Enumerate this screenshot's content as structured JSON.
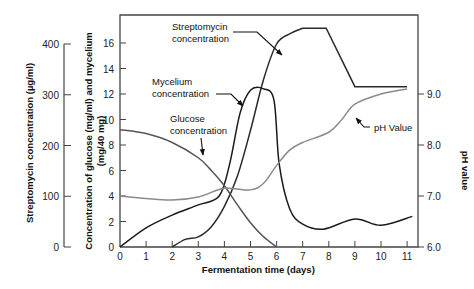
{
  "chart_data": {
    "type": "line",
    "title": "",
    "xlabel": "Fermentation time (days)",
    "x_ticks": [
      0,
      1,
      2,
      3,
      4,
      5,
      6,
      7,
      8,
      9,
      10,
      11
    ],
    "xlim": [
      0,
      11.4
    ],
    "axes": {
      "streptomycin": {
        "label": "Streptomycin concentration (µg/ml)",
        "ticks": [
          0,
          100,
          200,
          300,
          400
        ],
        "ylim": [
          0,
          400
        ]
      },
      "glucose_mycelium": {
        "label_line1": "Concentration of glucose (mg/ml) and mycelium",
        "label_line2": "(mg/40 mg)",
        "ticks": [
          0,
          2,
          4,
          6,
          8,
          10,
          12,
          14,
          16
        ],
        "ylim": [
          0,
          16
        ]
      },
      "ph": {
        "label": "pH value",
        "ticks": [
          "6.0",
          "7.0",
          "8.0",
          "9.0"
        ],
        "ylim": [
          6.0,
          9.0
        ]
      }
    },
    "series": [
      {
        "name": "Streptomycin concentration",
        "axis": "streptomycin",
        "unit": "µg/ml",
        "x": [
          2.0,
          2.5,
          3.0,
          3.5,
          4.0,
          4.5,
          5.0,
          5.5,
          6.0,
          6.5,
          7.0,
          7.9,
          9.0,
          11.0
        ],
        "y": [
          0,
          15,
          20,
          40,
          80,
          140,
          230,
          330,
          400,
          420,
          431,
          431,
          316,
          316
        ]
      },
      {
        "name": "Mycelium concentration",
        "axis": "glucose_mycelium",
        "unit": "mg/40 mg",
        "x": [
          0,
          1,
          2,
          3,
          3.8,
          4.2,
          4.6,
          5.0,
          5.5,
          5.9,
          6.1,
          6.5,
          7.0,
          7.8,
          9.0,
          10.0,
          11.2
        ],
        "y": [
          0,
          1.5,
          2.5,
          3.3,
          4.0,
          6.5,
          10.5,
          12.3,
          12.4,
          11.5,
          6.5,
          3.0,
          1.8,
          1.4,
          2.2,
          1.7,
          2.4
        ]
      },
      {
        "name": "Glucose concentration",
        "axis": "glucose_mycelium",
        "unit": "mg/ml",
        "x": [
          0,
          1,
          2,
          3,
          3.5,
          4,
          4.5,
          5,
          5.5,
          6
        ],
        "y": [
          9.2,
          8.9,
          8.2,
          7.0,
          6.0,
          4.8,
          3.3,
          1.9,
          0.8,
          0
        ]
      },
      {
        "name": "pH Value",
        "axis": "ph",
        "unit": "pH",
        "x": [
          0,
          1,
          2,
          3,
          4,
          5,
          5.5,
          6,
          6.5,
          7,
          8,
          8.5,
          9,
          10,
          11
        ],
        "y": [
          7.0,
          6.95,
          6.92,
          6.98,
          7.15,
          7.12,
          7.25,
          7.6,
          7.9,
          8.05,
          8.25,
          8.5,
          8.8,
          9.0,
          9.1
        ]
      }
    ],
    "annotations": [
      {
        "text_line1": "Streptomycin",
        "text_line2": "concentration",
        "points_to": "Streptomycin concentration"
      },
      {
        "text_line1": "Mycelium",
        "text_line2": "concentration",
        "points_to": "Mycelium concentration"
      },
      {
        "text_line1": "Glucose",
        "text_line2": "concentration",
        "points_to": "Glucose concentration"
      },
      {
        "text_line1": "pH Value",
        "points_to": "pH Value"
      }
    ],
    "grid": false,
    "legend": "none (inline annotations)"
  },
  "colors": {
    "streptomycin": "#2a2a2a",
    "mycelium": "#1a1a1a",
    "glucose": "#555555",
    "ph": "#8a8a8a",
    "axis": "#444444"
  }
}
